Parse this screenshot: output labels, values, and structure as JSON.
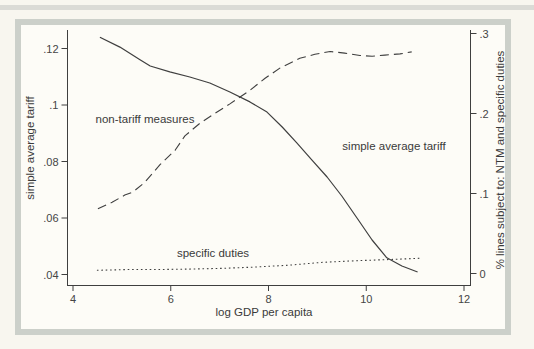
{
  "figure": {
    "page_background": "#f8f6ef",
    "frame_border_color": "#ccd0ca",
    "plot_background": "#fdfcf7",
    "line_color": "#3f3f3f",
    "text_color": "#3a3a3a"
  },
  "chart_data": {
    "type": "line",
    "title": "",
    "xlabel": "log GDP per capita",
    "ylabel_left": "simple average tariff",
    "ylabel_right": "% lines subject to: NTM and specific duties",
    "xlim": [
      3.9,
      12.15
    ],
    "ylim_left": [
      0.036,
      0.127
    ],
    "ylim_right": [
      0,
      0.3
    ],
    "grid": "off",
    "legend": "inline-annotations",
    "x_ticks": [
      {
        "label": "4",
        "value": 4
      },
      {
        "label": "6",
        "value": 6
      },
      {
        "label": "8",
        "value": 8
      },
      {
        "label": "10",
        "value": 10
      },
      {
        "label": "12",
        "value": 12
      }
    ],
    "left_ticks": [
      {
        "label": ".12",
        "value": 0.12
      },
      {
        "label": ".1",
        "value": 0.1
      },
      {
        "label": ".08",
        "value": 0.08
      },
      {
        "label": ".06",
        "value": 0.06
      },
      {
        "label": ".04",
        "value": 0.04
      }
    ],
    "right_ticks": [
      {
        "label": ".3",
        "value": 0.3
      },
      {
        "label": ".2",
        "value": 0.2
      },
      {
        "label": ".1",
        "value": 0.1
      },
      {
        "label": "0",
        "value": 0
      }
    ],
    "annotations": [
      {
        "text": "non-tariff measures",
        "x": 5.5,
        "y_left": 0.095
      },
      {
        "text": "simple average tariff",
        "x": 10.55,
        "y_left": 0.0855
      },
      {
        "text": "specific duties",
        "x": 6.85,
        "y_left": 0.0475
      }
    ],
    "series": [
      {
        "name": "simple average tariff",
        "axis": "left",
        "style": "solid",
        "points": [
          [
            4.55,
            0.124
          ],
          [
            4.96,
            0.1205
          ],
          [
            5.37,
            0.116
          ],
          [
            5.58,
            0.1138
          ],
          [
            5.98,
            0.1117
          ],
          [
            6.39,
            0.1099
          ],
          [
            6.8,
            0.1078
          ],
          [
            7.21,
            0.1046
          ],
          [
            7.62,
            0.1011
          ],
          [
            7.97,
            0.0975
          ],
          [
            8.28,
            0.0922
          ],
          [
            8.58,
            0.0866
          ],
          [
            8.89,
            0.0805
          ],
          [
            9.2,
            0.0745
          ],
          [
            9.5,
            0.0678
          ],
          [
            9.81,
            0.06
          ],
          [
            10.12,
            0.0522
          ],
          [
            10.42,
            0.0459
          ],
          [
            10.73,
            0.043
          ],
          [
            11.05,
            0.0409
          ]
        ]
      },
      {
        "name": "non-tariff measures",
        "axis": "right",
        "style": "dashed",
        "points": [
          [
            4.51,
            0.081
          ],
          [
            4.8,
            0.089
          ],
          [
            5.06,
            0.098
          ],
          [
            5.23,
            0.102
          ],
          [
            5.47,
            0.114
          ],
          [
            5.78,
            0.136
          ],
          [
            6.09,
            0.154
          ],
          [
            6.29,
            0.172
          ],
          [
            6.6,
            0.188
          ],
          [
            6.9,
            0.2
          ],
          [
            7.21,
            0.212
          ],
          [
            7.62,
            0.229
          ],
          [
            7.93,
            0.244
          ],
          [
            8.24,
            0.257
          ],
          [
            8.64,
            0.269
          ],
          [
            8.95,
            0.274
          ],
          [
            9.26,
            0.2775
          ],
          [
            9.56,
            0.2755
          ],
          [
            9.87,
            0.2725
          ],
          [
            10.12,
            0.2715
          ],
          [
            10.38,
            0.273
          ],
          [
            10.69,
            0.2745
          ],
          [
            10.93,
            0.277
          ]
        ]
      },
      {
        "name": "specific duties",
        "axis": "right",
        "style": "dotted",
        "points": [
          [
            4.49,
            0.004
          ],
          [
            5.17,
            0.005
          ],
          [
            5.78,
            0.005
          ],
          [
            6.39,
            0.0055
          ],
          [
            7.07,
            0.0065
          ],
          [
            7.72,
            0.008
          ],
          [
            8.44,
            0.0105
          ],
          [
            9.11,
            0.014
          ],
          [
            9.81,
            0.016
          ],
          [
            10.48,
            0.0175
          ],
          [
            11.1,
            0.019
          ]
        ]
      }
    ]
  }
}
